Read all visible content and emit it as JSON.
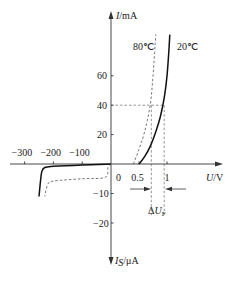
{
  "chart_data": {
    "type": "line",
    "title": "",
    "xlabel_var": "U",
    "xlabel_unit": "/V",
    "ylabel_pos_var": "I",
    "ylabel_pos_unit": "/mA",
    "ylabel_neg_var": "I",
    "ylabel_neg_sub": "S",
    "ylabel_neg_unit": "/μA",
    "x_ticks_pos": [
      {
        "v": 0,
        "label": "0"
      },
      {
        "v": 0.5,
        "label": "0.5"
      },
      {
        "v": 1,
        "label": "1"
      }
    ],
    "x_ticks_neg": [
      {
        "v": -100,
        "label": "−100"
      },
      {
        "v": -200,
        "label": "−200"
      },
      {
        "v": -300,
        "label": "−300"
      }
    ],
    "y_ticks_pos": [
      {
        "v": 20,
        "label": "20"
      },
      {
        "v": 40,
        "label": "40"
      },
      {
        "v": 60,
        "label": "60"
      }
    ],
    "y_ticks_neg": [
      {
        "v": -10,
        "label": "−10"
      },
      {
        "v": -20,
        "label": "−20"
      }
    ],
    "series": [
      {
        "name": "20℃",
        "style": "solid",
        "forward": [
          [
            0.5,
            0
          ],
          [
            0.6,
            5
          ],
          [
            0.7,
            12
          ],
          [
            0.8,
            22
          ],
          [
            0.88,
            32
          ],
          [
            0.95,
            45
          ],
          [
            1.0,
            60
          ],
          [
            1.03,
            75
          ],
          [
            1.05,
            88
          ]
        ],
        "reverse": [
          [
            0,
            0
          ],
          [
            -100,
            -0.3
          ],
          [
            -200,
            -0.8
          ],
          [
            -230,
            -1.2
          ],
          [
            -240,
            -2.5
          ],
          [
            -245,
            -6
          ],
          [
            -250,
            -11
          ]
        ]
      },
      {
        "name": "80℃",
        "style": "dashed",
        "forward": [
          [
            0.4,
            0
          ],
          [
            0.5,
            10
          ],
          [
            0.6,
            22
          ],
          [
            0.7,
            40
          ],
          [
            0.75,
            60
          ],
          [
            0.8,
            88
          ]
        ],
        "reverse": [
          [
            0,
            0
          ],
          [
            -10,
            -1
          ],
          [
            -20,
            -4.5
          ],
          [
            -100,
            -5
          ],
          [
            -200,
            -5.8
          ],
          [
            -220,
            -7
          ],
          [
            -230,
            -11
          ]
        ]
      }
    ],
    "guides": {
      "y_value": 40,
      "x_80C_at_40mA": 0.72,
      "x_20C_at_40mA": 0.95
    },
    "annotation": {
      "delta_label_prefix": "Δ",
      "delta_label_var": "U",
      "delta_label_sub": "F"
    }
  }
}
